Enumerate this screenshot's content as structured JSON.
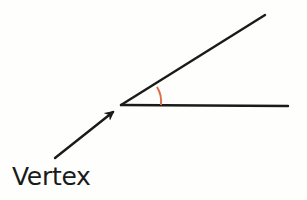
{
  "diagram": {
    "label": "Vertex",
    "colors": {
      "line": "#1a1a1a",
      "arc": "#d9704a",
      "background": "#fefefd"
    },
    "geometry": {
      "vertex": [
        121,
        105
      ],
      "upper_ray_end": [
        265,
        15
      ],
      "lower_ray_end": [
        288,
        106
      ],
      "arc": {
        "from": [
          157,
          86
        ],
        "to": [
          161,
          105
        ]
      },
      "arrow": {
        "from": [
          55,
          158
        ],
        "to": [
          115,
          111
        ]
      }
    }
  }
}
